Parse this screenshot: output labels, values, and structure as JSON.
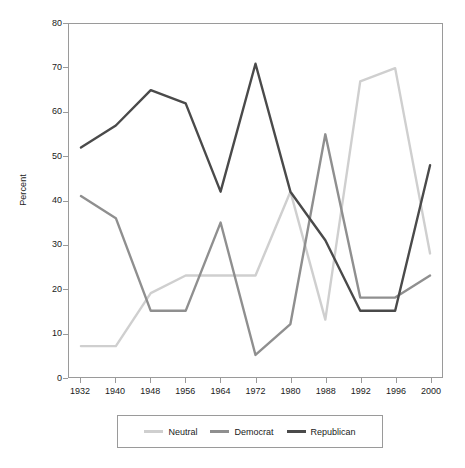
{
  "chart_data": {
    "type": "line",
    "title": "",
    "subtitle": "",
    "xlabel": "",
    "ylabel": "Percent",
    "x": [
      1932,
      1940,
      1948,
      1956,
      1964,
      1972,
      1980,
      1988,
      1992,
      1996,
      2000
    ],
    "categories": [
      "1932",
      "1940",
      "1948",
      "1956",
      "1964",
      "1972",
      "1980",
      "1988",
      "1992",
      "1996",
      "2000"
    ],
    "xlim": [
      1932,
      2000
    ],
    "ylim": [
      0,
      80
    ],
    "y_ticks": [
      0,
      10,
      20,
      30,
      40,
      50,
      60,
      70,
      80
    ],
    "y_tick_labels": [
      "0",
      "10",
      "20",
      "30",
      "40",
      "50",
      "60",
      "70",
      "80"
    ],
    "grid": false,
    "legend_position": "bottom",
    "series": [
      {
        "name": "Neutral",
        "color": "#cfcfcf",
        "values": [
          7,
          7,
          19,
          23,
          23,
          23,
          42,
          13,
          67,
          70,
          28
        ]
      },
      {
        "name": "Democrat",
        "color": "#8f8f8f",
        "values": [
          41,
          36,
          15,
          15,
          35,
          5,
          12,
          55,
          18,
          18,
          23
        ]
      },
      {
        "name": "Republican",
        "color": "#4a4a4a",
        "values": [
          52,
          57,
          65,
          62,
          42,
          71,
          42,
          31,
          15,
          15,
          48
        ]
      }
    ]
  },
  "legend": {
    "entries": [
      {
        "label": "Neutral"
      },
      {
        "label": "Democrat"
      },
      {
        "label": "Republican"
      }
    ]
  },
  "axes": {
    "y_title": "Percent"
  },
  "colors": {
    "neutral": "#cfcfcf",
    "democrat": "#8f8f8f",
    "republican": "#4a4a4a",
    "axis": "#9a9a9a",
    "text": "#1a1a1a",
    "background": "#ffffff"
  }
}
